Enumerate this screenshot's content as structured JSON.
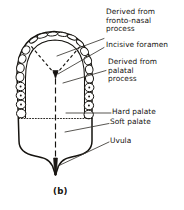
{
  "figure": {
    "caption": "(b)",
    "title_alt": "Inferior view of the palate showing embryological derivation",
    "colors": {
      "ink": "#15130f",
      "background": "#ffffff",
      "leader": "#3a3733",
      "foramen_marker": "#151311"
    }
  },
  "labels": [
    {
      "id": "derived-fronto-nasal",
      "lines": [
        "Derived from",
        "fronto-nasal",
        "process"
      ],
      "x": 106,
      "y": 9
    },
    {
      "id": "incisive-foramen",
      "lines": [
        "Incisive foramen"
      ],
      "x": 106,
      "y": 42
    },
    {
      "id": "derived-palatal",
      "lines": [
        "Derived from",
        "palatal",
        "process"
      ],
      "x": 108,
      "y": 61
    },
    {
      "id": "hard-palate",
      "lines": [
        "Hard palate"
      ],
      "x": 112,
      "y": 110
    },
    {
      "id": "soft-palate",
      "lines": [
        "Soft palate"
      ],
      "x": 110,
      "y": 120
    },
    {
      "id": "uvula",
      "lines": [
        "Uvula"
      ],
      "x": 110,
      "y": 139
    }
  ],
  "anatomy": {
    "structures": [
      "palatal-outline",
      "alveolar-arch",
      "teeth",
      "incisive-foramen-marker",
      "premaxilla-suture",
      "midline-raphe",
      "hard-soft-palate-boundary",
      "uvula"
    ],
    "teeth_count_left": 8,
    "teeth_count_right": 8,
    "incisor_slits_top": 4
  }
}
